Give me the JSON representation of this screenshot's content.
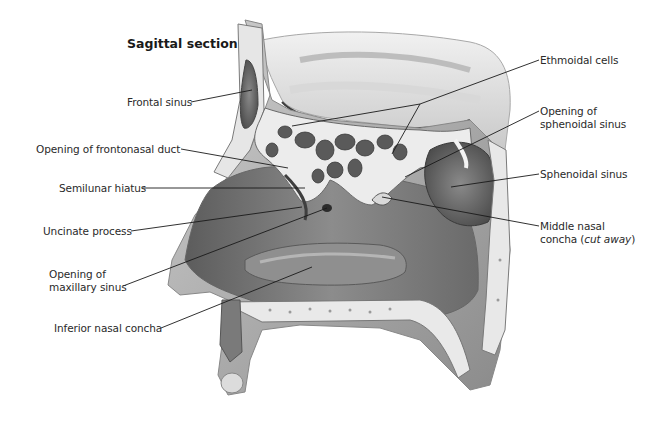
{
  "figure": {
    "title": "Sagittal section",
    "colors": {
      "ink": "#1a1a1a",
      "bone": "#e6e6e6",
      "cavity": "#6e6e6e",
      "mucosa": "#9a9a9a",
      "background": "#ffffff"
    }
  },
  "labels": {
    "frontal_sinus": "Frontal sinus",
    "opening_frontonasal_duct": "Opening of frontonasal duct",
    "semilunar_hiatus": "Semilunar hiatus",
    "uncinate_process": "Uncinate process",
    "opening_maxillary_sinus_line1": "Opening of",
    "opening_maxillary_sinus_line2": "maxillary sinus",
    "inferior_nasal_concha": "Inferior nasal concha",
    "ethmoidal_cells": "Ethmoidal cells",
    "opening_sphenoidal_sinus_line1": "Opening of",
    "opening_sphenoidal_sinus_line2": "sphenoidal sinus",
    "sphenoidal_sinus": "Sphenoidal sinus",
    "middle_nasal_concha_line1": "Middle nasal",
    "middle_nasal_concha_line2a": "concha (",
    "middle_nasal_concha_line2b": "cut away",
    "middle_nasal_concha_line2c": ")"
  }
}
